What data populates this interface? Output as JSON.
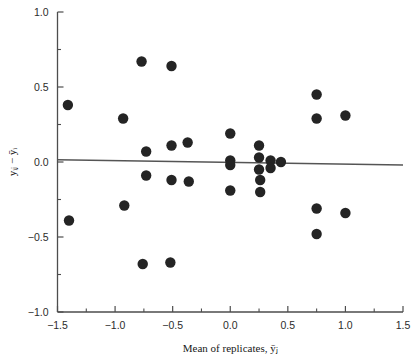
{
  "chart_data": {
    "type": "scatter",
    "title": "",
    "xlabel": "Mean of replicates, ȳⱼ",
    "ylabel": "yᵢⱼ − ȳᵢ",
    "xlim": [
      -1.5,
      1.5
    ],
    "ylim": [
      -1.0,
      1.0
    ],
    "xticks": [
      -1.5,
      -1.0,
      -0.5,
      0.0,
      0.5,
      1.0,
      1.5
    ],
    "xticklabels": [
      "-1.5",
      "-1.0",
      "-0.5",
      "0.0",
      "0.5",
      "1.0",
      "1.5"
    ],
    "yticks": [
      -1.0,
      -0.5,
      0.0,
      0.5,
      1.0
    ],
    "yticklabels": [
      "-1.0",
      "-0.5",
      "0.0",
      "0.5",
      "1.0"
    ],
    "minor_xticks": [
      -1.25,
      -0.75,
      -0.25,
      0.25,
      0.75,
      1.25
    ],
    "minor_yticks": [
      -0.75,
      -0.25,
      0.25,
      0.75
    ],
    "grid": false,
    "legend": false,
    "marker": "filled-circle",
    "marker_color": "#242424",
    "marker_size": 5.2,
    "reference_line": {
      "label": "fitted horizontal reference line",
      "color": "#555555",
      "x_start": -1.5,
      "y_start": 0.015,
      "x_end": 1.5,
      "y_end": -0.02
    },
    "points": [
      {
        "x": -1.41,
        "y": 0.38
      },
      {
        "x": -1.4,
        "y": -0.39
      },
      {
        "x": -0.93,
        "y": 0.29
      },
      {
        "x": -0.92,
        "y": -0.29
      },
      {
        "x": -0.77,
        "y": 0.67
      },
      {
        "x": -0.73,
        "y": 0.07
      },
      {
        "x": -0.73,
        "y": -0.09
      },
      {
        "x": -0.76,
        "y": -0.68
      },
      {
        "x": -0.51,
        "y": 0.64
      },
      {
        "x": -0.51,
        "y": 0.11
      },
      {
        "x": -0.51,
        "y": -0.12
      },
      {
        "x": -0.52,
        "y": -0.67
      },
      {
        "x": -0.37,
        "y": 0.13
      },
      {
        "x": -0.36,
        "y": -0.13
      },
      {
        "x": 0.0,
        "y": 0.19
      },
      {
        "x": 0.0,
        "y": 0.01
      },
      {
        "x": 0.0,
        "y": -0.02
      },
      {
        "x": 0.0,
        "y": -0.19
      },
      {
        "x": 0.25,
        "y": 0.11
      },
      {
        "x": 0.25,
        "y": 0.03
      },
      {
        "x": 0.25,
        "y": -0.05
      },
      {
        "x": 0.26,
        "y": -0.12
      },
      {
        "x": 0.26,
        "y": -0.2
      },
      {
        "x": 0.35,
        "y": 0.01
      },
      {
        "x": 0.35,
        "y": -0.04
      },
      {
        "x": 0.44,
        "y": 0.0
      },
      {
        "x": 0.75,
        "y": 0.45
      },
      {
        "x": 0.75,
        "y": 0.29
      },
      {
        "x": 0.75,
        "y": -0.31
      },
      {
        "x": 0.75,
        "y": -0.48
      },
      {
        "x": 1.0,
        "y": 0.31
      },
      {
        "x": 1.0,
        "y": -0.34
      }
    ]
  }
}
